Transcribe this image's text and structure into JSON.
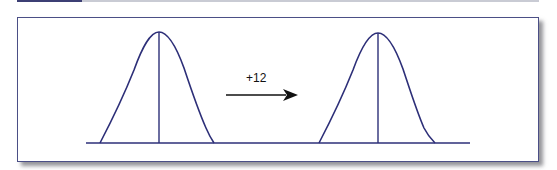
{
  "figure": {
    "shift_label": "+12",
    "colors": {
      "curve": "#2d2f78",
      "frame_border": "#4b4f86",
      "arrow": "#111111",
      "background": "#ffffff"
    },
    "curves": [
      {
        "name": "original-distribution",
        "mean_x": 159,
        "peak_y": 32,
        "left_foot_x": 100,
        "right_foot_x": 214
      },
      {
        "name": "shifted-distribution",
        "mean_x": 378,
        "peak_y": 33,
        "left_foot_x": 319,
        "right_foot_x": 435
      }
    ],
    "baseline": {
      "x1": 86,
      "x2": 470,
      "y": 143
    },
    "arrow": {
      "x1": 226,
      "x2": 297,
      "y": 95,
      "direction": "right"
    }
  }
}
